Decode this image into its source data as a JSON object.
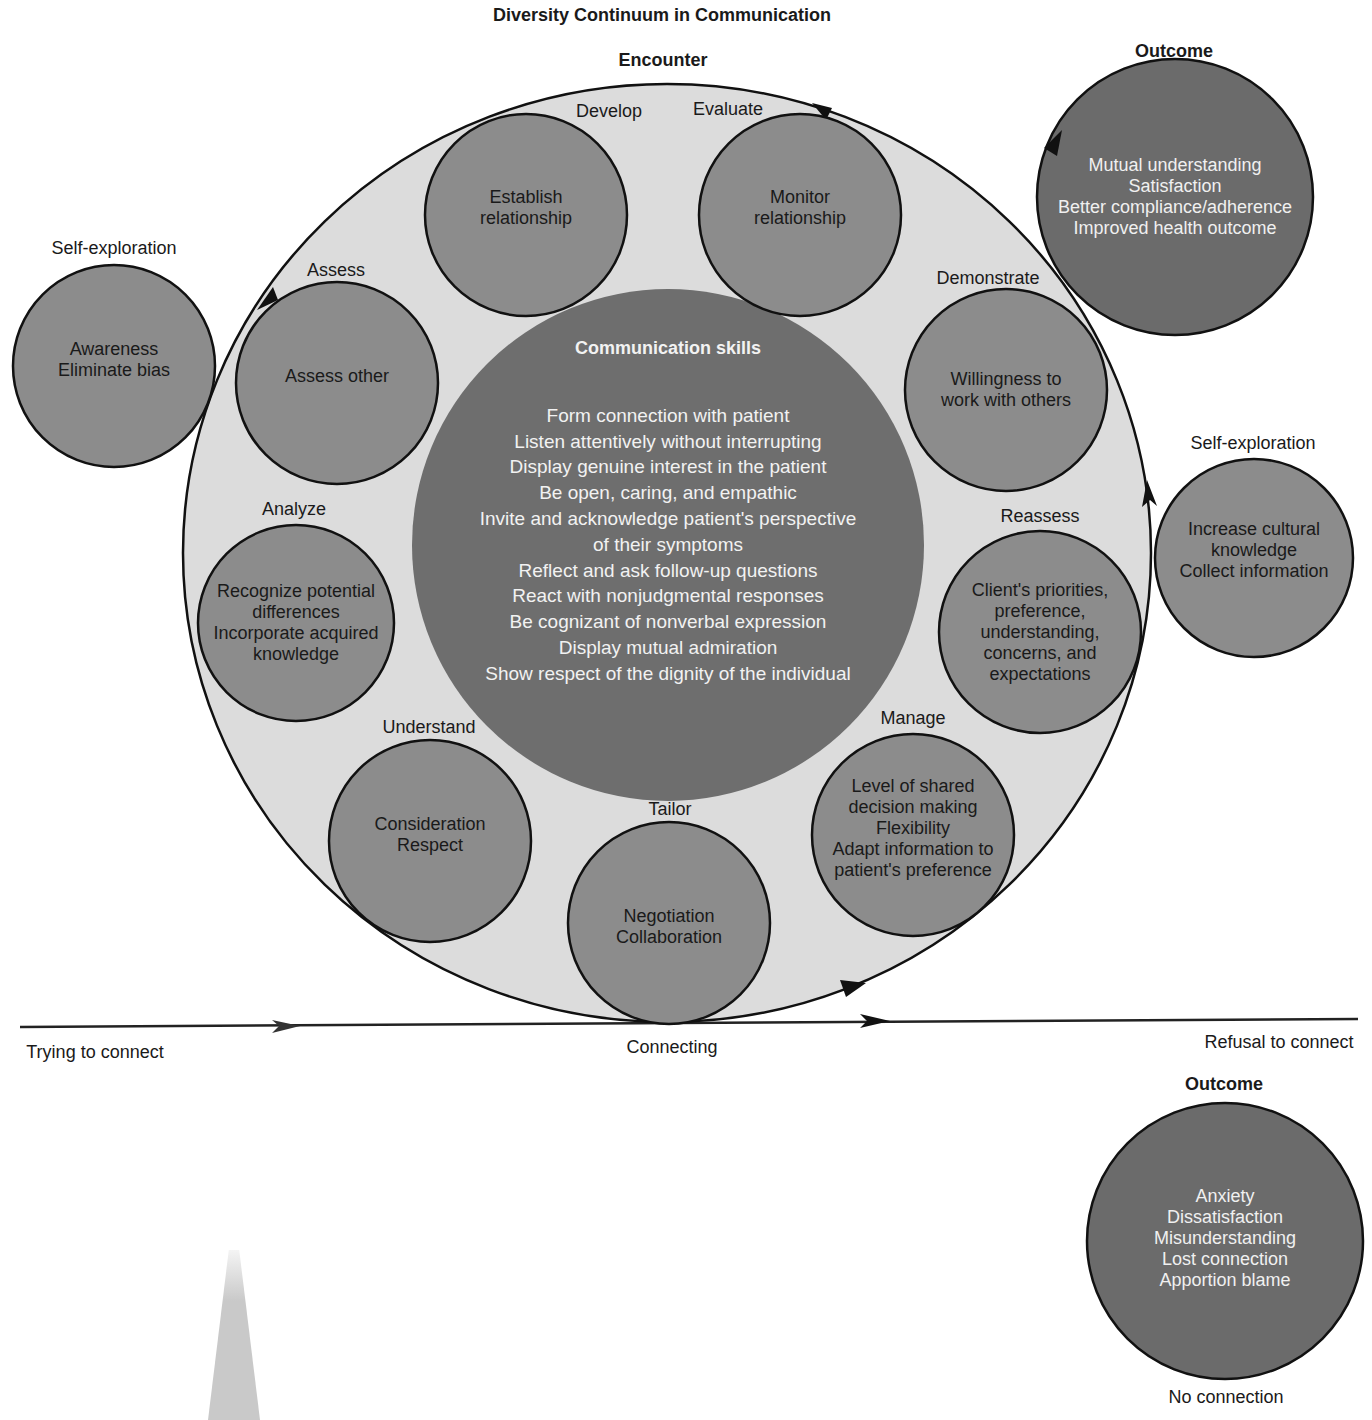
{
  "title": "Diversity Continuum in Communication",
  "encounter_label": "Encounter",
  "colors": {
    "ring_fill": "#dcdcdc",
    "node_fill": "#8c8c8c",
    "center_fill": "#6e6e6e",
    "outcome_fill": "#6b6b6b",
    "stroke": "#111111"
  },
  "center": {
    "title": "Communication skills",
    "lines": [
      "Form connection with patient",
      "Listen attentively without interrupting",
      "Display genuine interest in the patient",
      "Be open, caring, and empathic",
      "Invite and acknowledge patient's perspective",
      "of their symptoms",
      "Reflect and ask follow-up questions",
      "React with nonjudgmental responses",
      "Be cognizant of nonverbal expression",
      "Display mutual admiration",
      "Show respect of the dignity of the individual"
    ]
  },
  "stages": [
    {
      "label": "Develop",
      "lines": [
        "Establish",
        "relationship"
      ]
    },
    {
      "label": "Evaluate",
      "lines": [
        "Monitor",
        "relationship"
      ]
    },
    {
      "label": "Demonstrate",
      "lines": [
        "Willingness to",
        "work with others"
      ]
    },
    {
      "label": "Reassess",
      "lines": [
        "Client's priorities,",
        "preference,",
        "understanding,",
        "concerns, and",
        "expectations"
      ]
    },
    {
      "label": "Manage",
      "lines": [
        "Level of shared",
        "decision making",
        "Flexibility",
        "Adapt information to",
        "patient's preference"
      ]
    },
    {
      "label": "Tailor",
      "lines": [
        "Negotiation",
        "Collaboration"
      ]
    },
    {
      "label": "Understand",
      "lines": [
        "Consideration",
        "Respect"
      ]
    },
    {
      "label": "Analyze",
      "lines": [
        "Recognize potential",
        "differences",
        "Incorporate acquired",
        "knowledge"
      ]
    },
    {
      "label": "Assess",
      "lines": [
        "Assess other"
      ]
    }
  ],
  "self_exploration": [
    {
      "label": "Self-exploration",
      "lines": [
        "Awareness",
        "Eliminate bias"
      ]
    },
    {
      "label": "Self-exploration",
      "lines": [
        "Increase cultural",
        "knowledge",
        "Collect information"
      ]
    }
  ],
  "outcomes": [
    {
      "label": "Outcome",
      "lines": [
        "Mutual understanding",
        "Satisfaction",
        "Better compliance/adherence",
        "Improved health outcome"
      ]
    },
    {
      "label": "Outcome",
      "lines": [
        "Anxiety",
        "Dissatisfaction",
        "Misunderstanding",
        "Lost connection",
        "Apportion blame"
      ],
      "caption": "No connection"
    }
  ],
  "continuum": {
    "start": "Trying to connect",
    "middle": "Connecting",
    "end": "Refusal to connect"
  }
}
